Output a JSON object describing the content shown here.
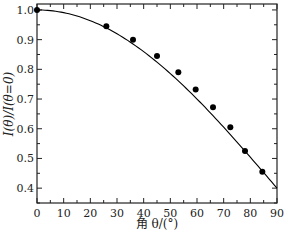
{
  "chart_data": {
    "type": "scatter",
    "title": "",
    "xlabel": "角 θ/(°)",
    "ylabel": "I(θ)/I(θ=0)",
    "xlim": [
      0,
      90
    ],
    "ylim": [
      0.35,
      1.02
    ],
    "xticks": [
      0,
      10,
      20,
      30,
      40,
      50,
      60,
      70,
      80,
      90
    ],
    "xtick_labels": [
      "0",
      "10",
      "20",
      "30",
      "40",
      "50",
      "60",
      "70",
      "80",
      "90"
    ],
    "yticks": [
      0.4,
      0.5,
      0.6,
      0.7,
      0.8,
      0.9,
      1.0
    ],
    "ytick_labels": [
      "0.4",
      "0.5",
      "0.6",
      "0.7",
      "0.8",
      "0.9",
      "1.0"
    ],
    "grid": false,
    "legend": null,
    "series": [
      {
        "name": "measured",
        "kind": "scatter",
        "marker": "filled-circle",
        "color": "#000000",
        "x": [
          0,
          26,
          36,
          45,
          53,
          59.5,
          66,
          72.5,
          78,
          84.5
        ],
        "y": [
          1.0,
          0.945,
          0.9,
          0.845,
          0.79,
          0.732,
          0.672,
          0.605,
          0.525,
          0.455
        ]
      },
      {
        "name": "theory",
        "kind": "line",
        "color": "#000000",
        "x": [
          0,
          10,
          20,
          30,
          40,
          50,
          60,
          70,
          80,
          90
        ],
        "y": [
          1.0,
          0.991,
          0.964,
          0.92,
          0.86,
          0.786,
          0.7,
          0.605,
          0.504,
          0.4
        ]
      }
    ]
  }
}
